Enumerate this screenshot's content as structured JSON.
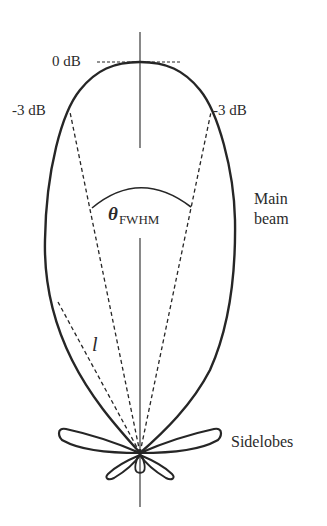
{
  "diagram": {
    "type": "antenna radiation pattern (polar lobe diagram)",
    "labels": {
      "zero_db": "0 dB",
      "minus3db_left": "-3 dB",
      "minus3db_right": "-3 dB",
      "theta_symbol": "θ",
      "theta_subscript": "FWHM",
      "length_symbol": "l",
      "main_beam_line1": "Main",
      "main_beam_line2": "beam",
      "sidelobes": "Sidelobes"
    },
    "colors": {
      "stroke": "#262626",
      "text": "#2a2a2a",
      "background": "#ffffff"
    },
    "elements": {
      "boresight_axis": "vertical solid line through lobe center",
      "zero_db_line": "horizontal dashed line tangent to main lobe peak",
      "half_power_lines": "two dashed lines from origin to -3 dB points",
      "fwhm_arc": "solid arc between half-power lines",
      "length_line": "dashed line from origin to main lobe edge (l)",
      "main_lobe": "large teardrop lobe pointing up",
      "sidelobes": "two large horizontal side lobes, two smaller lower lobes, one small back lobe"
    }
  }
}
